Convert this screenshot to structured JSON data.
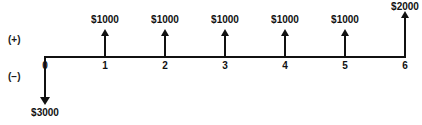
{
  "diagram": {
    "type": "cash-flow-timeline",
    "axis": {
      "start_px": 44,
      "end_px": 406,
      "baseline_y_px": 56,
      "period_spacing_px": 60
    },
    "sign_labels": {
      "positive": "(+)",
      "negative": "(−)"
    },
    "period_ticks": [
      {
        "label": "0",
        "x": 45
      },
      {
        "label": "1",
        "x": 105
      },
      {
        "label": "2",
        "x": 165
      },
      {
        "label": "3",
        "x": 225
      },
      {
        "label": "4",
        "x": 285
      },
      {
        "label": "5",
        "x": 345
      },
      {
        "label": "6",
        "x": 405
      }
    ],
    "inflows": [
      {
        "period": "1",
        "amount": "$1000",
        "x": 105,
        "arrow_height": 22,
        "label_y": 14
      },
      {
        "period": "2",
        "amount": "$1000",
        "x": 165,
        "arrow_height": 22,
        "label_y": 14
      },
      {
        "period": "3",
        "amount": "$1000",
        "x": 225,
        "arrow_height": 22,
        "label_y": 14
      },
      {
        "period": "4",
        "amount": "$1000",
        "x": 285,
        "arrow_height": 22,
        "label_y": 14
      },
      {
        "period": "5",
        "amount": "$1000",
        "x": 345,
        "arrow_height": 22,
        "label_y": 14
      },
      {
        "period": "6",
        "amount": "$2000",
        "x": 405,
        "arrow_height": 40,
        "label_y": 1
      }
    ],
    "outflow": {
      "period": "0",
      "amount": "$3000",
      "x": 45,
      "arrow_height": 40
    }
  }
}
